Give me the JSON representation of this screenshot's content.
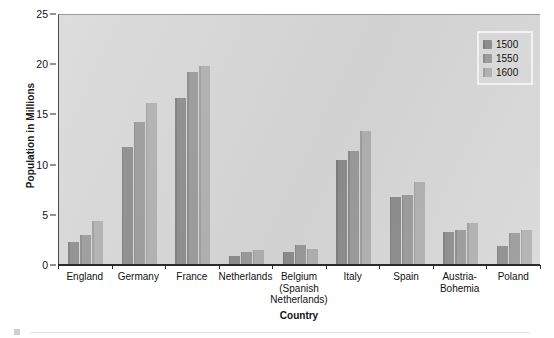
{
  "chart_data": {
    "type": "bar",
    "title": "",
    "xlabel": "Country",
    "ylabel": "Population in Millions",
    "ylim": [
      0,
      25
    ],
    "yticks": [
      0,
      5,
      10,
      15,
      20,
      25
    ],
    "grid": false,
    "legend_position": "top-right",
    "categories": [
      "England",
      "Germany",
      "France",
      "Netherlands",
      "Belgium\n(Spanish\nNetherlands)",
      "Italy",
      "Spain",
      "Austria-\nBohemia",
      "Poland"
    ],
    "category_lines": [
      [
        "England"
      ],
      [
        "Germany"
      ],
      [
        "France"
      ],
      [
        "Netherlands"
      ],
      [
        "Belgium",
        "(Spanish",
        "Netherlands)"
      ],
      [
        "Italy"
      ],
      [
        "Spain"
      ],
      [
        "Austria-",
        "Bohemia"
      ],
      [
        "Poland"
      ]
    ],
    "series": [
      {
        "name": "1500",
        "color": "#8d8d8d",
        "values": [
          2.3,
          11.8,
          16.6,
          0.9,
          1.3,
          10.5,
          6.8,
          3.3,
          1.9
        ]
      },
      {
        "name": "1550",
        "color": "#9b9b9b",
        "values": [
          3.0,
          14.2,
          19.2,
          1.3,
          2.0,
          11.4,
          7.0,
          3.5,
          3.2
        ]
      },
      {
        "name": "1600",
        "color": "#b1b1b1",
        "values": [
          4.4,
          16.1,
          19.8,
          1.5,
          1.6,
          13.3,
          8.3,
          4.2,
          3.5
        ]
      }
    ]
  },
  "legend": {
    "entries": [
      "1500",
      "1550",
      "1600"
    ]
  },
  "axes": {
    "y_title": "Population in Millions",
    "x_title": "Country",
    "y_tick_labels": [
      "0",
      "5",
      "10",
      "15",
      "20",
      "25"
    ]
  },
  "colors": {
    "plot_background": "#d8d8d8",
    "axis": "#2b2b2b",
    "series_1500": "#8d8d8d",
    "series_1550": "#9b9b9b",
    "series_1600": "#b1b1b1"
  }
}
